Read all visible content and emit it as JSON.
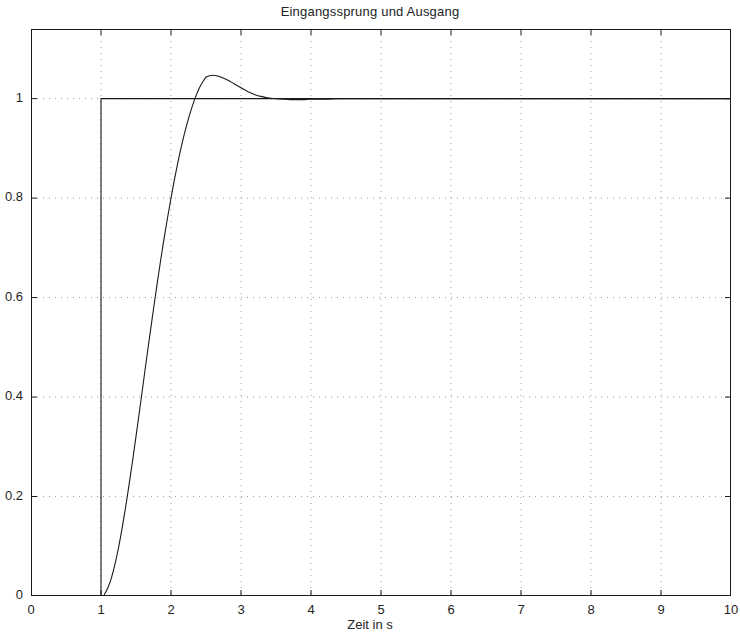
{
  "chart_data": {
    "type": "line",
    "title": "Eingangssprung und Ausgang",
    "xlabel": "Zeit in s",
    "ylabel": "",
    "xlim": [
      0,
      10
    ],
    "ylim": [
      0,
      1.14
    ],
    "grid": true,
    "grid_style": "dotted",
    "legend": null,
    "xticks": [
      "0",
      "1",
      "2",
      "3",
      "4",
      "5",
      "6",
      "7",
      "8",
      "9",
      "10"
    ],
    "xtick_values": [
      0,
      1,
      2,
      3,
      4,
      5,
      6,
      7,
      8,
      9,
      10
    ],
    "yticks": [
      "0",
      "0.2",
      "0.4",
      "0.6",
      "0.8",
      "1"
    ],
    "ytick_values": [
      0,
      0.2,
      0.4,
      0.6,
      0.8,
      1
    ],
    "line_color": "#1a1a1a",
    "line_width": 1,
    "series": [
      {
        "name": "Eingangssprung",
        "kind": "step",
        "x": [
          0,
          1,
          1,
          10
        ],
        "values": [
          0,
          0,
          1,
          1
        ]
      },
      {
        "name": "Ausgang",
        "kind": "step-response",
        "x": [
          0.0,
          0.5,
          1.0,
          1.05,
          1.1,
          1.15,
          1.2,
          1.25,
          1.3,
          1.35,
          1.4,
          1.45,
          1.5,
          1.55,
          1.6,
          1.65,
          1.7,
          1.75,
          1.8,
          1.85,
          1.9,
          1.95,
          2.0,
          2.05,
          2.1,
          2.15,
          2.2,
          2.25,
          2.3,
          2.35,
          2.4,
          2.45,
          2.5,
          2.55,
          2.6,
          2.65,
          2.7,
          2.8,
          2.9,
          3.0,
          3.1,
          3.2,
          3.3,
          3.4,
          3.5,
          3.6,
          3.7,
          3.8,
          3.9,
          4.0,
          4.2,
          4.4,
          4.6,
          4.8,
          5.0,
          6.0,
          7.0,
          8.0,
          9.0,
          10.0
        ],
        "values": [
          0.0,
          0.0,
          0.0,
          0.004,
          0.017,
          0.037,
          0.064,
          0.097,
          0.135,
          0.177,
          0.223,
          0.271,
          0.321,
          0.372,
          0.424,
          0.476,
          0.527,
          0.577,
          0.626,
          0.673,
          0.718,
          0.76,
          0.8,
          0.838,
          0.873,
          0.905,
          0.934,
          0.96,
          0.983,
          1.003,
          1.02,
          1.033,
          1.043,
          1.046,
          1.047,
          1.046,
          1.044,
          1.038,
          1.03,
          1.022,
          1.014,
          1.008,
          1.004,
          1.001,
          1.0,
          0.999,
          0.998,
          0.998,
          0.998,
          0.999,
          0.999,
          1.0,
          1.0,
          1.0,
          1.0,
          1.0,
          1.0,
          1.0,
          1.0,
          1.0
        ],
        "peak_value": 1.047,
        "peak_time": 2.6,
        "overshoot_percent": 4.7,
        "step_time": 1.0,
        "final_value": 1.0
      }
    ]
  }
}
